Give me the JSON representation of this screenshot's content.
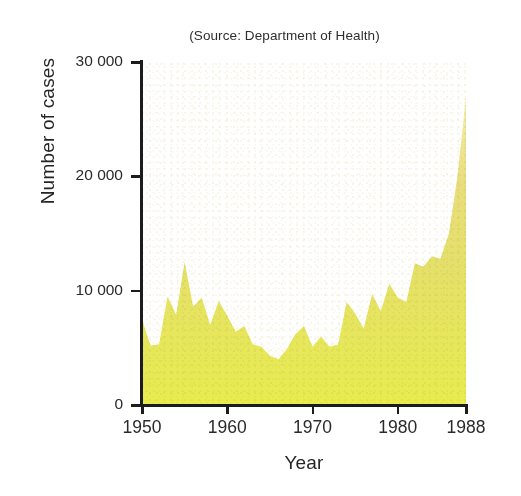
{
  "chart_data": {
    "type": "area",
    "title": "(Source: Department of Health)",
    "xlabel": "Year",
    "ylabel": "Number of cases",
    "grid": false,
    "legend": "none",
    "xlim": [
      1950,
      1988
    ],
    "ylim": [
      0,
      30000
    ],
    "xticks": [
      "1950",
      "1960",
      "1970",
      "1980",
      "1988"
    ],
    "xtick_values": [
      1950,
      1960,
      1970,
      1980,
      1988
    ],
    "yticks": [
      "0",
      "10 000",
      "20 000",
      "30 000"
    ],
    "ytick_values": [
      0,
      10000,
      20000,
      30000
    ],
    "series_name": "Number of cases",
    "fill_color": "#e9e84d",
    "fill_color_top": "#f2eca0",
    "fill_color_mid": "#e2d878",
    "axis_color": "#1c1c1c",
    "x": [
      1950,
      1951,
      1952,
      1953,
      1954,
      1955,
      1956,
      1957,
      1958,
      1959,
      1960,
      1961,
      1962,
      1963,
      1964,
      1965,
      1966,
      1967,
      1968,
      1969,
      1970,
      1971,
      1972,
      1973,
      1974,
      1975,
      1976,
      1977,
      1978,
      1979,
      1980,
      1981,
      1982,
      1983,
      1984,
      1985,
      1986,
      1987,
      1988
    ],
    "values": [
      7500,
      5200,
      5300,
      9500,
      7900,
      12500,
      8600,
      9400,
      7000,
      9100,
      7800,
      6400,
      6900,
      5300,
      5100,
      4300,
      4000,
      4900,
      6200,
      6900,
      5100,
      6000,
      5100,
      5300,
      9000,
      8000,
      6700,
      9700,
      8200,
      10600,
      9400,
      9000,
      12400,
      12100,
      13000,
      12800,
      15000,
      20000,
      27000
    ],
    "peak": {
      "year": 1988,
      "value": 27000
    },
    "trough": {
      "year": 1966,
      "value": 4000
    },
    "early_peak": {
      "year": 1955,
      "value": 12500
    }
  }
}
